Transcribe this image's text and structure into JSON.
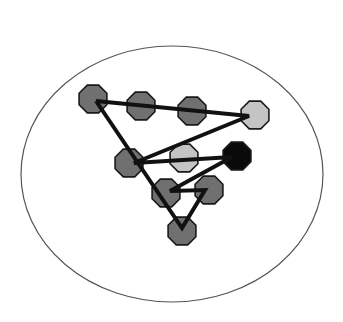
{
  "diagram": {
    "type": "node-path-in-ellipse",
    "boundary": {
      "cx": 172,
      "cy": 174,
      "rx": 151,
      "ry": 128,
      "stroke": "#555555"
    },
    "node_radius": 15,
    "colors": {
      "dark": "#707070",
      "light": "#c4c4c4",
      "black": "#0a0a0a",
      "outline": "#1a1a1a",
      "edge": "#111111"
    },
    "nodes": [
      {
        "id": "A",
        "x": 93,
        "y": 99,
        "shade": "dark"
      },
      {
        "id": "B",
        "x": 141,
        "y": 106,
        "shade": "dark"
      },
      {
        "id": "C",
        "x": 192,
        "y": 111,
        "shade": "dark"
      },
      {
        "id": "D",
        "x": 255,
        "y": 115,
        "shade": "light"
      },
      {
        "id": "E",
        "x": 129,
        "y": 163,
        "shade": "dark"
      },
      {
        "id": "F",
        "x": 184,
        "y": 158,
        "shade": "light"
      },
      {
        "id": "G",
        "x": 237,
        "y": 156,
        "shade": "black"
      },
      {
        "id": "H",
        "x": 166,
        "y": 193,
        "shade": "dark"
      },
      {
        "id": "I",
        "x": 209,
        "y": 190,
        "shade": "dark"
      },
      {
        "id": "J",
        "x": 182,
        "y": 231,
        "shade": "dark"
      }
    ],
    "path": [
      {
        "x": 96,
        "y": 101
      },
      {
        "x": 249,
        "y": 116
      },
      {
        "x": 134,
        "y": 163
      },
      {
        "x": 232,
        "y": 157
      },
      {
        "x": 170,
        "y": 191
      },
      {
        "x": 205,
        "y": 190
      },
      {
        "x": 182,
        "y": 228
      },
      {
        "x": 96,
        "y": 101
      }
    ]
  }
}
